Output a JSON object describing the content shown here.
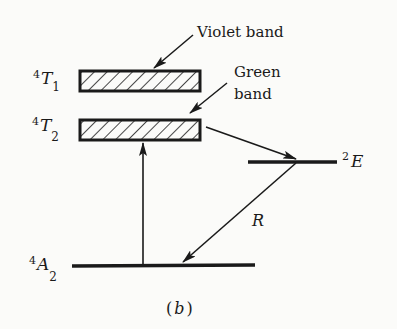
{
  "diagram": {
    "caption": "(b)",
    "caption_letter": "b",
    "levels": [
      {
        "id": "4T1",
        "sup": "4",
        "symbol": "T",
        "sub": "1",
        "type": "band",
        "annotation": "Violet band"
      },
      {
        "id": "4T2",
        "sup": "4",
        "symbol": "T",
        "sub": "2",
        "type": "band",
        "annotation_line1": "Green",
        "annotation_line2": "band"
      },
      {
        "id": "2E",
        "sup": "2",
        "symbol": "E",
        "type": "level"
      },
      {
        "id": "4A2",
        "sup": "4",
        "symbol": "A",
        "sub": "2",
        "type": "ground"
      }
    ],
    "transitions": [
      {
        "from": "4A2",
        "to": "4T2",
        "label": "",
        "kind": "absorption"
      },
      {
        "from": "4T2",
        "to": "2E",
        "label": "",
        "kind": "nonradiative"
      },
      {
        "from": "2E",
        "to": "4A2",
        "label": "R",
        "kind": "emission"
      }
    ]
  }
}
